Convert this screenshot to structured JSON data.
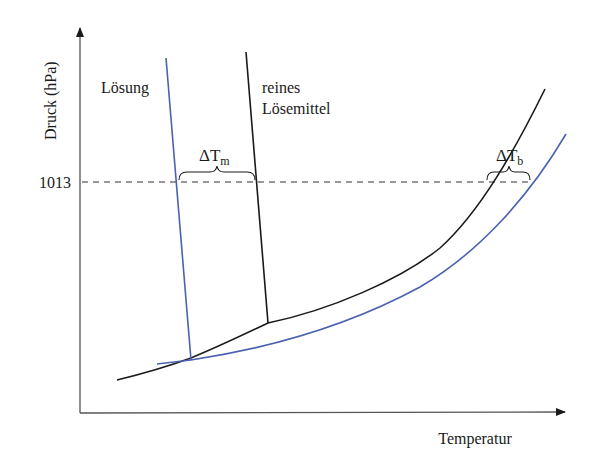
{
  "diagram": {
    "type": "phase-diagram",
    "y_axis": {
      "label": "Druck (hPa)",
      "tick": "1013"
    },
    "x_axis": {
      "label": "Temperatur"
    },
    "curves": {
      "solution": {
        "label": "Lösung",
        "color": "#4a62b0"
      },
      "pure_solvent": {
        "label_line1": "reines",
        "label_line2": "Lösemittel",
        "color": "#1a1a1a"
      }
    },
    "annotations": {
      "melting": {
        "delta": "ΔT",
        "sub": "m"
      },
      "boiling": {
        "delta": "ΔT",
        "sub": "b"
      }
    }
  }
}
